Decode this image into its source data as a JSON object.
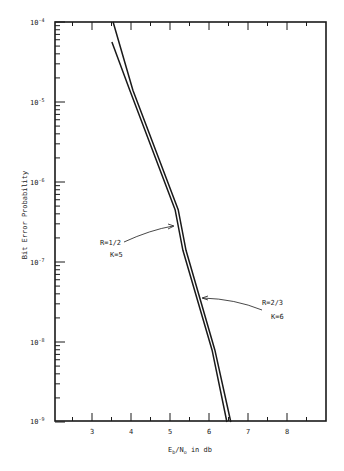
{
  "chart_data": {
    "type": "line",
    "title": "",
    "xlabel": "E_b/N_0 in db",
    "ylabel": "Bit Error Probability",
    "xscale": "linear",
    "yscale": "log",
    "xlim": [
      2.05,
      9.0
    ],
    "ylim": [
      1e-09,
      0.0001
    ],
    "x_ticks": [
      3,
      4,
      5,
      6,
      7,
      8
    ],
    "x_tick_labels": [
      "3",
      "4",
      "5",
      "6",
      "7",
      "8"
    ],
    "y_ticks": [
      0.0001,
      1e-05,
      1e-06,
      1e-07,
      1e-08,
      1e-09
    ],
    "y_tick_labels": [
      "10^-4",
      "10^-5",
      "10^-6",
      "10^-7",
      "10^-8",
      "10^-9"
    ],
    "grid": false,
    "legend": "none (inline annotations with arrows)",
    "series": [
      {
        "name": "R=1/2 K=5",
        "x": [
          3.51,
          3.97,
          5.13,
          5.33,
          6.08,
          6.46
        ],
        "y": [
          5.6e-05,
          1.4e-05,
          4.5e-07,
          1.4e-07,
          7.9e-09,
          1e-09
        ]
      },
      {
        "name": "R=2/3 K=6",
        "x": [
          3.54,
          4.05,
          5.21,
          5.41,
          6.15,
          6.56
        ],
        "y": [
          0.0001,
          1.4e-05,
          4.5e-07,
          1.4e-07,
          7.9e-09,
          1e-09
        ]
      }
    ],
    "annotations": [
      {
        "text_line1": "R=1/2",
        "text_line2": "K=5",
        "points_to_series": "R=1/2 K=5",
        "at": [
          5.2,
          3e-07
        ]
      },
      {
        "text_line1": "R=2/3",
        "text_line2": "K=6",
        "points_to_series": "R=2/3 K=6",
        "at": [
          5.7,
          3.5e-08
        ]
      }
    ]
  },
  "labels": {
    "ylabel": "Bit Error Probability",
    "xlabel_E": "E",
    "xlabel_b": "b",
    "xlabel_slash": "/N",
    "xlabel_o": "o",
    "xlabel_rest": " in db",
    "ann1_l1": "R=1/2",
    "ann1_l2": "K=5",
    "ann2_l1": "R=2/3",
    "ann2_l2": "K=6",
    "y_base": "10",
    "y_exp_4": "-4",
    "y_exp_5": "-5",
    "y_exp_6": "-6",
    "y_exp_7": "-7",
    "y_exp_8": "-8",
    "y_exp_9": "-9",
    "x3": "3",
    "x4": "4",
    "x5": "5",
    "x6": "6",
    "x7": "7",
    "x8": "8"
  }
}
